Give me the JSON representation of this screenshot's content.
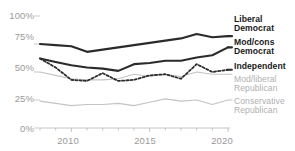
{
  "chart_data": {
    "type": "line",
    "title": "",
    "subtitle": "",
    "xlabel": "",
    "ylabel": "",
    "xlim": [
      2008,
      2020
    ],
    "ylim": [
      0,
      100
    ],
    "grid": false,
    "legend_position": "right-inline",
    "x": [
      2008,
      2009,
      2010,
      2011,
      2012,
      2013,
      2014,
      2015,
      2016,
      2017,
      2018,
      2019,
      2020
    ],
    "y_ticks": [
      0,
      25,
      50,
      75,
      100
    ],
    "y_tick_labels": [
      "0%",
      "25%",
      "50%",
      "75%",
      "100%"
    ],
    "x_ticks": [
      2008,
      2009,
      2010,
      2011,
      2012,
      2013,
      2014,
      2015,
      2016,
      2017,
      2018,
      2019,
      2020
    ],
    "x_tick_labels": [
      "2010",
      "2015",
      "2020"
    ],
    "x_tick_label_values": [
      2010,
      2015,
      2020
    ],
    "series": [
      {
        "name": "Liberal Democrat",
        "label_lines": [
          "Liberal",
          "Democrat"
        ],
        "style": "solid",
        "color": "#2b2b2b",
        "width": 2.1,
        "emphasis": "dark",
        "values": [
          75,
          74,
          73,
          68,
          70,
          72,
          74,
          76,
          78,
          80,
          84,
          81,
          82
        ]
      },
      {
        "name": "Mod/cons Democrat",
        "label_lines": [
          "Mod/cons",
          "Democrat"
        ],
        "style": "solid",
        "color": "#2b2b2b",
        "width": 2.1,
        "emphasis": "dark",
        "values": [
          62,
          59,
          56,
          54,
          53,
          51,
          57,
          58,
          60,
          60,
          63,
          65,
          72
        ]
      },
      {
        "name": "Independent",
        "label_lines": [
          "Independent"
        ],
        "style": "dotted",
        "color": "#2b2b2b",
        "width": 1.8,
        "emphasis": "dark",
        "values": [
          62,
          54,
          43,
          42,
          49,
          42,
          43,
          47,
          48,
          44,
          57,
          50,
          52
        ]
      },
      {
        "name": "Mod/liberal Republican",
        "label_lines": [
          "Mod/liberal",
          "Republican"
        ],
        "style": "solid",
        "color": "#c4c4c4",
        "width": 1.1,
        "emphasis": "muted",
        "values": [
          50,
          47,
          44,
          43,
          43,
          44,
          48,
          46,
          48,
          46,
          50,
          48,
          48
        ]
      },
      {
        "name": "Conservative Republican",
        "label_lines": [
          "Conservative",
          "Republican"
        ],
        "style": "solid",
        "color": "#c4c4c4",
        "width": 1.1,
        "emphasis": "muted",
        "values": [
          24,
          22,
          20,
          21,
          21,
          22,
          20,
          23,
          26,
          24,
          25,
          21,
          25
        ]
      }
    ]
  },
  "axis": {
    "y_labels": [
      "100%",
      "75%",
      "50%",
      "25%",
      "0%"
    ],
    "x_labels": [
      "2010",
      "2015",
      "2020"
    ]
  },
  "labels": {
    "liberal_democrat_1": "Liberal",
    "liberal_democrat_2": "Democrat",
    "modcons_democrat_1": "Mod/cons",
    "modcons_democrat_2": "Democrat",
    "independent_1": "Independent",
    "modliberal_republican_1": "Mod/liberal",
    "modliberal_republican_2": "Republican",
    "conservative_republican_1": "Conservative",
    "conservative_republican_2": "Republican"
  },
  "colors": {
    "dark_series": "#2b2b2b",
    "muted_series": "#c4c4c4",
    "axis_text": "#9a9a9a",
    "axis_line": "#bdbdbd",
    "background": "#ffffff"
  }
}
